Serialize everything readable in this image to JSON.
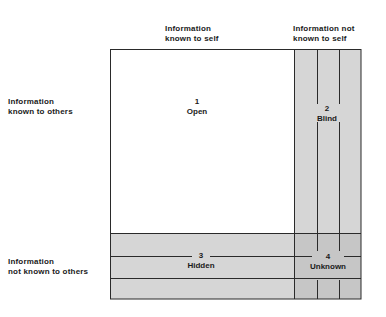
{
  "diagram": {
    "column_headers": [
      {
        "line1": "Information",
        "line2": "known to self"
      },
      {
        "line1": "Information not",
        "line2": "known to self"
      }
    ],
    "row_headers": [
      {
        "line1": "Information",
        "line2": "known to others"
      },
      {
        "line1": "Information",
        "line2": "not known to others"
      }
    ],
    "quadrants": [
      {
        "number": "1",
        "name": "Open"
      },
      {
        "number": "2",
        "name": "Blind"
      },
      {
        "number": "3",
        "name": "Hidden"
      },
      {
        "number": "4",
        "name": "Unknown"
      }
    ],
    "colors": {
      "background": "#ffffff",
      "open_fill": "#ffffff",
      "shaded_fill": "#d6d6d6",
      "unknown_fill": "#c6c6c6",
      "line": "#2a2a2a",
      "text": "#1a1a1a"
    }
  }
}
